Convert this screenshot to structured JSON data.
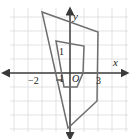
{
  "figure": {
    "name": "coordinate-plane-quadrilateral-dilation",
    "width": 131,
    "height": 139,
    "background_color": "#ffffff",
    "grid": {
      "color": "#d9d9d9",
      "spacing_px": 14,
      "origin_px": {
        "x": 70,
        "y": 73
      },
      "visible": true
    },
    "axes": {
      "color": "#3a3a3a",
      "x_axis_label": "x",
      "y_axis_label": "y",
      "x_axis_y_px": 73,
      "y_axis_x_px": 70
    },
    "labels": {
      "origin": "O",
      "x_tick_negative": "−2",
      "x_tick_positive": "3",
      "y_tick_up": "1",
      "y_tick_down": "1",
      "axis_x": "x",
      "axis_y": "y"
    },
    "shapes": [
      {
        "name": "outer-quadrilateral",
        "stroke_color": "#6e6e6e",
        "fill": "none",
        "stroke_width": 1.4,
        "vertices_px": [
          {
            "x": 42,
            "y": 12
          },
          {
            "x": 98,
            "y": 32
          },
          {
            "x": 97,
            "y": 101
          },
          {
            "x": 68,
            "y": 128
          }
        ],
        "vertices_units": [
          {
            "x": -2,
            "y": 4.4
          },
          {
            "x": 2,
            "y": 2.9
          },
          {
            "x": 1.9,
            "y": -2
          },
          {
            "x": -0.1,
            "y": -3.9
          }
        ]
      },
      {
        "name": "inner-quadrilateral",
        "stroke_color": "#6e6e6e",
        "fill": "none",
        "stroke_width": 1.4,
        "vertices_px": [
          {
            "x": 56,
            "y": 41
          },
          {
            "x": 84,
            "y": 46
          },
          {
            "x": 83,
            "y": 73
          },
          {
            "x": 77,
            "y": 87
          },
          {
            "x": 64,
            "y": 87
          }
        ],
        "vertices_units": [
          {
            "x": -1,
            "y": 2.3
          },
          {
            "x": 1,
            "y": 1.9
          },
          {
            "x": 0.9,
            "y": 0
          },
          {
            "x": 0.5,
            "y": -1
          },
          {
            "x": -0.4,
            "y": -1
          }
        ]
      }
    ],
    "tick_marks": [
      {
        "name": "y-tick-negative-one",
        "x_px": 60,
        "y_px": 80
      }
    ]
  }
}
